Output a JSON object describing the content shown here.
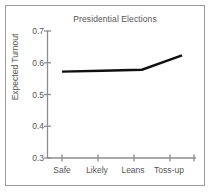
{
  "chart_data": {
    "type": "line",
    "title": "Presidential Elections",
    "xlabel": "",
    "ylabel": "Expected Turnout",
    "categories": [
      "Safe",
      "Likely",
      "Leans",
      "Toss-up"
    ],
    "values": [
      0.572,
      0.575,
      0.578,
      0.623
    ],
    "ylim": [
      0.3,
      0.7
    ],
    "yticks": [
      0.3,
      0.4,
      0.5,
      0.6,
      0.7
    ],
    "ytick_labels": [
      "0.3",
      "0.4",
      "0.5",
      "0.6",
      "0.7"
    ],
    "grid": false,
    "legend": false,
    "line_color": "#101010",
    "axis_color": "#8c8c8c",
    "text_color": "#555555",
    "background": "#ffffff",
    "border_color": "#9a9a9a"
  }
}
